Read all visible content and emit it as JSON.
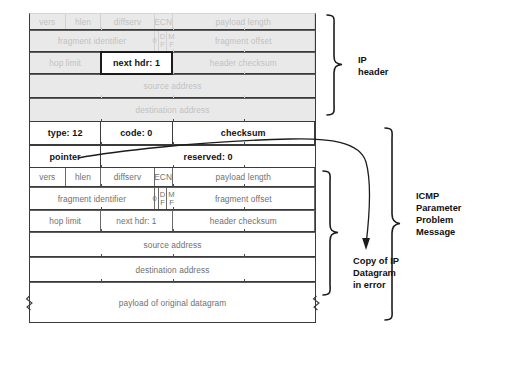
{
  "diagram": {
    "title": "ICMP Parameter Problem Message",
    "colors": {
      "faded_bg": "#e9e9e9",
      "faded_text": "#c2c2c2",
      "plain_text": "#6f6f6f",
      "bold_text": "#111111",
      "border": "#3a3a3a",
      "highlight_border": "#1c1c1c"
    }
  },
  "ip_header_faded": {
    "row1": {
      "vers": "vers",
      "hlen": "hlen",
      "diffserv": "diffserv",
      "ecn": "ECN",
      "payload_length": "payload length"
    },
    "row2": {
      "fragment_identifier": "fragment identifier",
      "flag_zero": "0",
      "flag_df_top": "D",
      "flag_df_bottom": "F",
      "flag_mf_top": "M",
      "flag_mf_bottom": "F",
      "fragment_offset": "fragment offset"
    },
    "row3": {
      "hop_limit": "hop limit",
      "next_hdr": "next hdr: 1",
      "header_checksum": "header checksum"
    },
    "row4": {
      "source_address": "source address"
    },
    "row5": {
      "destination_address": "destination address"
    }
  },
  "icmp_header": {
    "row1": {
      "type": "type: 12",
      "code": "code: 0",
      "checksum": "checksum"
    },
    "row2": {
      "pointer": "pointer",
      "reserved": "reserved: 0"
    }
  },
  "ip_copy": {
    "row1": {
      "vers": "vers",
      "hlen": "hlen",
      "diffserv": "diffserv",
      "ecn": "ECN",
      "payload_length": "payload length"
    },
    "row2": {
      "fragment_identifier": "fragment identifier",
      "flag_zero": "0",
      "flag_df_top": "D",
      "flag_df_bottom": "F",
      "flag_mf_top": "M",
      "flag_mf_bottom": "F",
      "fragment_offset": "fragment offset"
    },
    "row3": {
      "hop_limit": "hop limit",
      "next_hdr": "next hdr: 1",
      "header_checksum": "header checksum"
    },
    "row4": {
      "source_address": "source address"
    },
    "row5": {
      "destination_address": "destination address"
    },
    "row6": {
      "payload": "payload of original datagram"
    }
  },
  "annotations": {
    "ip_header_label": "IP\nheader",
    "copy_label": "Copy of IP\nDatagram\nin error",
    "icmp_label": "ICMP\nParameter\nProblem\nMessage"
  }
}
